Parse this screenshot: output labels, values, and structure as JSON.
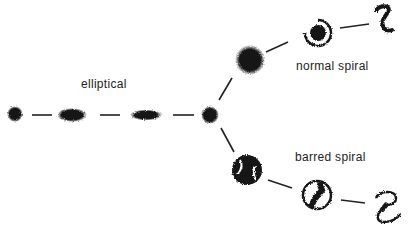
{
  "labels": {
    "elliptical": "elliptical",
    "normal_spiral": "normal spiral",
    "barred_spiral": "barred spiral"
  },
  "colors": {
    "ink": "#151515",
    "background": "#ffffff"
  },
  "galaxies": {
    "elliptical": [
      {
        "name": "E0",
        "shape": "round",
        "cx": 15,
        "cy": 114
      },
      {
        "name": "E3",
        "shape": "ellipse",
        "cx": 72,
        "cy": 115
      },
      {
        "name": "E5",
        "shape": "elongated-ellipse",
        "cx": 146,
        "cy": 115
      }
    ],
    "lenticular": {
      "name": "S0",
      "shape": "round",
      "cx": 210,
      "cy": 115
    },
    "normal_spiral": [
      {
        "name": "Sa",
        "cx": 250,
        "cy": 60
      },
      {
        "name": "Sb",
        "cx": 318,
        "cy": 33
      },
      {
        "name": "Sc",
        "cx": 384,
        "cy": 20
      }
    ],
    "barred_spiral": [
      {
        "name": "SBa",
        "cx": 247,
        "cy": 170
      },
      {
        "name": "SBb",
        "cx": 317,
        "cy": 195
      },
      {
        "name": "SBc",
        "cx": 386,
        "cy": 205
      }
    ]
  }
}
